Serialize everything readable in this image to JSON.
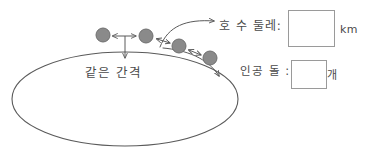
{
  "worksheet": {
    "background_color": "#ffffff",
    "ink_color": "#5a5a5a",
    "stone_fill_color": "#8a8a8a",
    "stone_stroke_color": "#6f6f6f"
  },
  "diagram": {
    "lake": {
      "shape_name": "lake-ellipse",
      "center_x": 125,
      "center_y": 99,
      "radius_x": 113,
      "radius_y": 47
    },
    "stones": [
      {
        "name": "stone-1",
        "cx": 103,
        "cy": 35,
        "r": 7
      },
      {
        "name": "stone-2",
        "cx": 146,
        "cy": 36,
        "r": 7
      },
      {
        "name": "stone-3",
        "cx": 179,
        "cy": 46,
        "r": 7
      },
      {
        "name": "stone-4",
        "cx": 210,
        "cy": 58,
        "r": 7
      }
    ],
    "spacing_arrows": [
      {
        "name": "spacing-arrow-1-2",
        "x1": 113,
        "y1": 36,
        "x2": 136,
        "y2": 36
      },
      {
        "name": "spacing-arrow-2-3",
        "x1": 156,
        "y1": 39,
        "x2": 170,
        "y2": 43
      },
      {
        "name": "spacing-arrow-3-4",
        "x1": 188,
        "y1": 50,
        "x2": 201,
        "y2": 55
      }
    ],
    "pointer_to_spacing_label": {
      "name": "spacing-pointer",
      "x": 125,
      "y_top": 36,
      "y_bottom": 60
    }
  },
  "labels": {
    "spacing": "같은 간격",
    "perimeter": "호 수 둘레:",
    "stones": "인공 돌 :",
    "unit_km": "km",
    "unit_count": "개"
  },
  "answers": {
    "perimeter_value": "",
    "stones_value": ""
  }
}
